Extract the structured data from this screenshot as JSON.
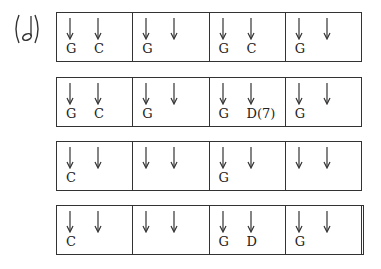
{
  "label": {
    "icon": "half-note-icon",
    "text": "(𝅗𝅥)"
  },
  "rows": [
    {
      "final": false,
      "measures": [
        {
          "chords": [
            "G",
            "C"
          ]
        },
        {
          "chords": [
            "G",
            ""
          ]
        },
        {
          "chords": [
            "G",
            "C"
          ]
        },
        {
          "chords": [
            "G",
            ""
          ]
        }
      ]
    },
    {
      "final": false,
      "measures": [
        {
          "chords": [
            "G",
            "C"
          ]
        },
        {
          "chords": [
            "G",
            ""
          ]
        },
        {
          "chords": [
            "G",
            "D(7)"
          ]
        },
        {
          "chords": [
            "G",
            ""
          ]
        }
      ]
    },
    {
      "final": false,
      "measures": [
        {
          "chords": [
            "C",
            ""
          ]
        },
        {
          "chords": [
            "",
            ""
          ]
        },
        {
          "chords": [
            "G",
            ""
          ]
        },
        {
          "chords": [
            "",
            ""
          ]
        }
      ]
    },
    {
      "final": true,
      "measures": [
        {
          "chords": [
            "C",
            ""
          ]
        },
        {
          "chords": [
            "",
            ""
          ]
        },
        {
          "chords": [
            "G",
            "D"
          ]
        },
        {
          "chords": [
            "G",
            ""
          ]
        }
      ]
    }
  ]
}
